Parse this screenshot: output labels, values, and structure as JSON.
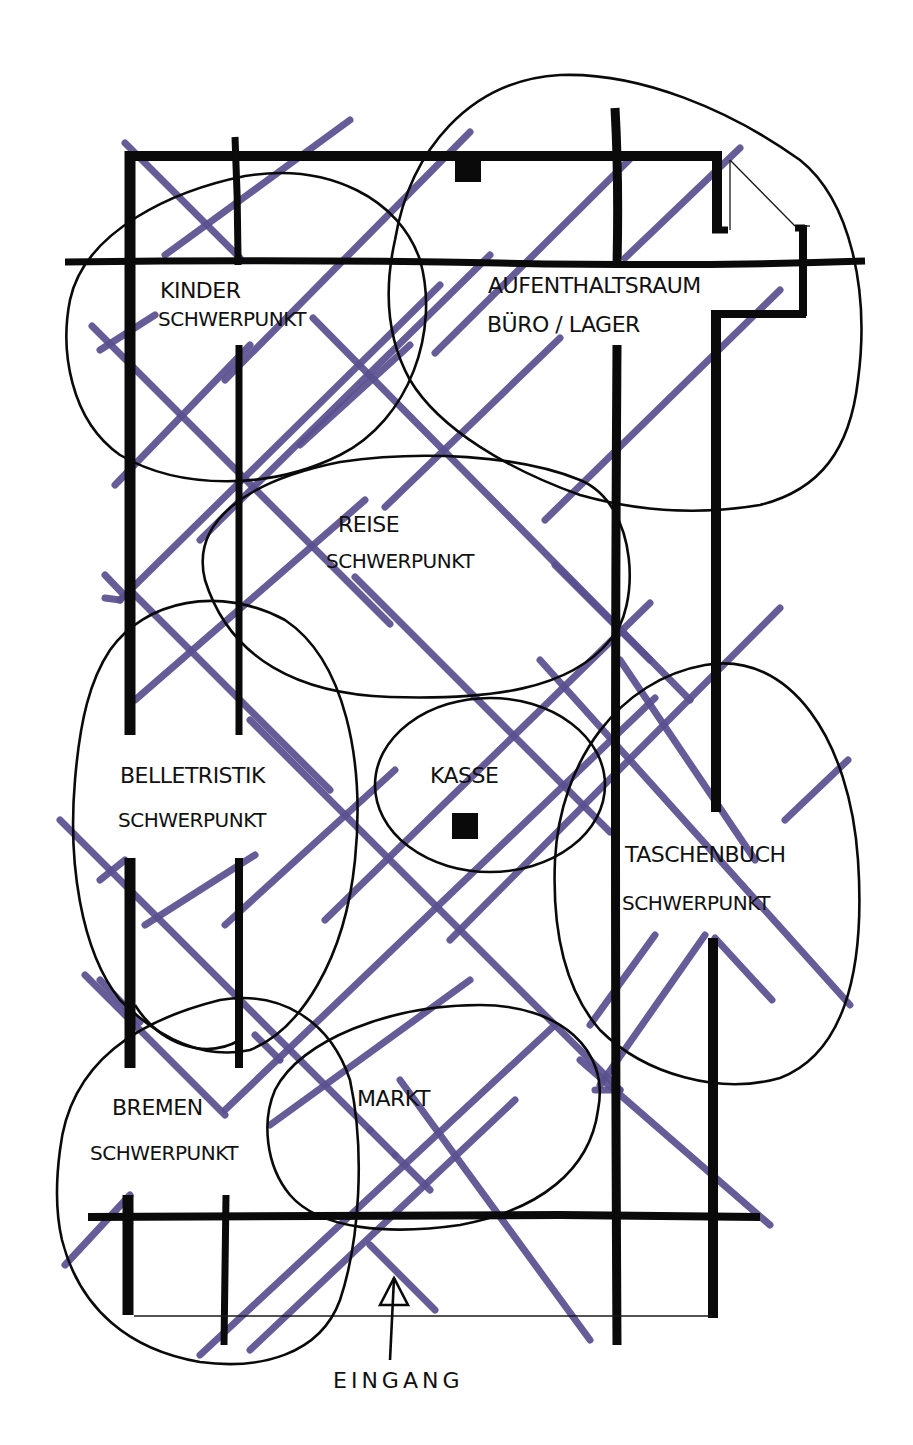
{
  "diagram": {
    "type": "floor-plan-sketch",
    "colors": {
      "walls": "#0a0a0a",
      "zones": "#0a0a0a",
      "grid": "#5a5090",
      "background": "#ffffff"
    },
    "zones": [
      {
        "id": "kinder",
        "line1": "KINDER",
        "line2": "SCHWERPUNKT"
      },
      {
        "id": "aufenthalt",
        "line1": "AUFENTHALTSRAUM",
        "line2": "BÜRO / LAGER"
      },
      {
        "id": "reise",
        "line1": "REISE",
        "line2": "SCHWERPUNKT"
      },
      {
        "id": "belletristik",
        "line1": "BELLETRISTIK",
        "line2": "SCHWERPUNKT"
      },
      {
        "id": "kasse",
        "line1": "KASSE",
        "line2": ""
      },
      {
        "id": "taschenbuch",
        "line1": "TASCHENBUCH",
        "line2": "SCHWERPUNKT"
      },
      {
        "id": "bremen",
        "line1": "BREMEN",
        "line2": "SCHWERPUNKT"
      },
      {
        "id": "markt",
        "line1": "MARKT",
        "line2": ""
      }
    ],
    "entrance": {
      "label": "EINGANG",
      "icon": "arrow-up-icon"
    }
  }
}
